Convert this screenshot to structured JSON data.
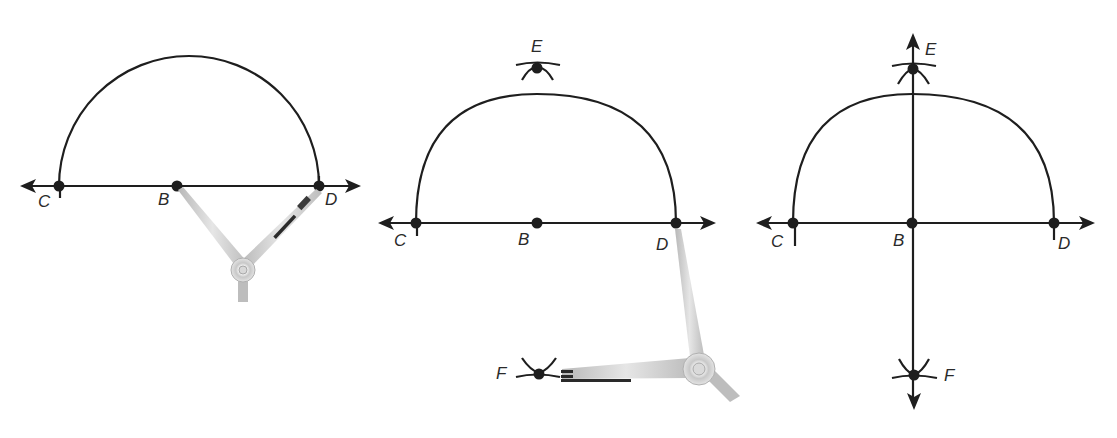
{
  "diagram": {
    "type": "geometric-construction",
    "colors": {
      "ink": "#1e1e1e",
      "compass_body": "#d9d9d9",
      "compass_shadow": "#a8a8a8",
      "background": "#ffffff"
    },
    "panels": [
      {
        "step": 1,
        "points": {
          "C": "C",
          "B": "B",
          "D": "D"
        },
        "elements": [
          "line CD with arrows",
          "semicircle centered at B through C and D",
          "compass at B and D"
        ]
      },
      {
        "step": 2,
        "points": {
          "C": "C",
          "B": "B",
          "D": "D",
          "E": "E",
          "F": "F"
        },
        "elements": [
          "line CD with arrows",
          "semicircle",
          "arc intersection E above",
          "arc intersection F below",
          "compass from D to F"
        ]
      },
      {
        "step": 3,
        "points": {
          "C": "C",
          "B": "B",
          "D": "D",
          "E": "E",
          "F": "F"
        },
        "elements": [
          "line CD with arrows",
          "semicircle",
          "line EF through B perpendicular to CD"
        ]
      }
    ]
  }
}
